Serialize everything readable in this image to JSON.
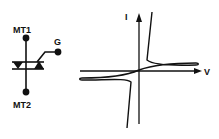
{
  "figure": {
    "symbol": {
      "terminal_1_label": "MT1",
      "terminal_2_label": "MT2",
      "gate_label": "G"
    },
    "characteristic": {
      "y_axis_label": "I",
      "x_axis_label": "V"
    },
    "colors": {
      "ink": "#111111",
      "background": "#ffffff"
    }
  }
}
